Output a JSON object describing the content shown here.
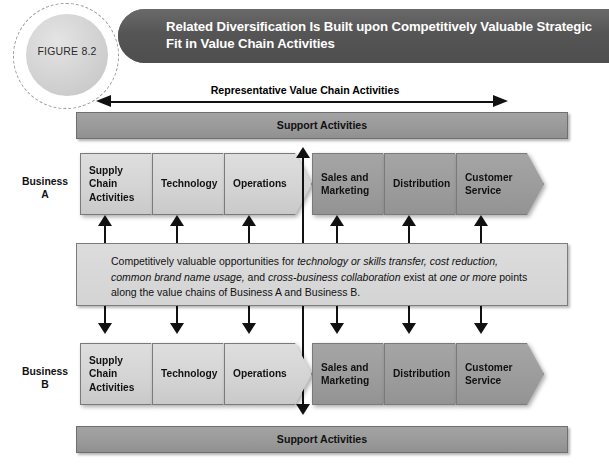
{
  "figure": {
    "number_label": "FIGURE 8.2",
    "title": "Related Diversification Is Built upon Competitively Valuable Strategic Fit in Value Chain Activities"
  },
  "diagram": {
    "top_axis_label": "Representative Value Chain Activities",
    "support_bar_top_label": "Support Activities",
    "support_bar_bottom_label": "Support Activities",
    "business_a_label": "Business\nA",
    "business_a_label_line1": "Business",
    "business_a_label_line2": "A",
    "business_b_label_line1": "Business",
    "business_b_label_line2": "B",
    "business_a_chain": [
      {
        "label": "Supply Chain Activities",
        "shade": "light"
      },
      {
        "label": "Technology",
        "shade": "light"
      },
      {
        "label": "Operations",
        "shade": "light"
      },
      {
        "label": "Sales and Marketing",
        "shade": "dark"
      },
      {
        "label": "Distribution",
        "shade": "dark"
      },
      {
        "label": "Customer Service",
        "shade": "dark"
      }
    ],
    "business_b_chain": [
      {
        "label": "Supply Chain Activities",
        "shade": "light"
      },
      {
        "label": "Technology",
        "shade": "light"
      },
      {
        "label": "Operations",
        "shade": "light"
      },
      {
        "label": "Sales and Marketing",
        "shade": "dark"
      },
      {
        "label": "Distribution",
        "shade": "dark"
      },
      {
        "label": "Customer Service",
        "shade": "dark"
      }
    ],
    "note": {
      "segment_1": "Competitively valuable opportunities for ",
      "segment_2_italic": "technology or skills transfer, cost reduction, common brand name usage,",
      "segment_3": " and ",
      "segment_4_italic": "cross-business collaboration",
      "segment_5": " exist at ",
      "segment_6_italic": "one or more",
      "segment_7": " points along the value chains of Business A and Business B.",
      "full_text": "Competitively valuable opportunities for technology or skills transfer, cost reduction, common brand name usage, and cross-business collaboration exist at one or more points along the value chains of Business A and Business B."
    }
  },
  "colors": {
    "header_bar": "#5c5c5c",
    "support_bar": "#9a9a9a",
    "chevron_light": "#d4d4d4",
    "chevron_dark": "#9b9b9b",
    "note_box": "#d8d8d8",
    "arrow": "#111111",
    "figure_circle": "#d2d2d2"
  }
}
